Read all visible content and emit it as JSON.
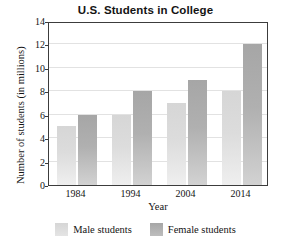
{
  "chart_data": {
    "type": "bar",
    "title": "U.S. Students in College",
    "xlabel": "Year",
    "ylabel": "Number of students (in millions)",
    "categories": [
      "1984",
      "1994",
      "2004",
      "2014"
    ],
    "series": [
      {
        "name": "Male students",
        "values": [
          5,
          6,
          7,
          8
        ],
        "color": "#dcdcdc"
      },
      {
        "name": "Female students",
        "values": [
          6,
          8,
          9,
          12
        ],
        "color": "#ababab"
      }
    ],
    "ylim": [
      0,
      14
    ],
    "yticks": [
      0,
      2,
      4,
      6,
      8,
      10,
      12,
      14
    ],
    "ytick_labels": [
      "0",
      "2",
      "4",
      "6",
      "8",
      "10",
      "12",
      "14"
    ],
    "grid": true,
    "grid_axis": "y",
    "legend_position": "bottom"
  },
  "legend": {
    "items": [
      {
        "label": "Male students",
        "swatch": "male-swatch"
      },
      {
        "label": "Female students",
        "swatch": "female-swatch"
      }
    ]
  }
}
